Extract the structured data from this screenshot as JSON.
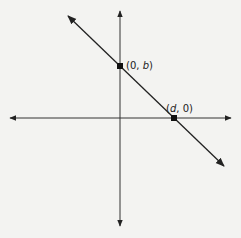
{
  "diagram": {
    "type": "coordinate-plane",
    "axes": {
      "x_axis": {
        "arrows": "both"
      },
      "y_axis": {
        "arrows": "both"
      }
    },
    "line": {
      "slope_sign": "negative",
      "arrows": "both"
    },
    "points": [
      {
        "name": "y-intercept",
        "open_paren": "(",
        "x": "0",
        "sep": ", ",
        "y": "b",
        "close_paren": ")"
      },
      {
        "name": "x-intercept",
        "open_paren": "(",
        "x": "d",
        "sep": ", ",
        "y": "0",
        "close_paren": ")"
      }
    ]
  },
  "colors": {
    "background": "#f3f3f1",
    "ink": "#222222"
  }
}
